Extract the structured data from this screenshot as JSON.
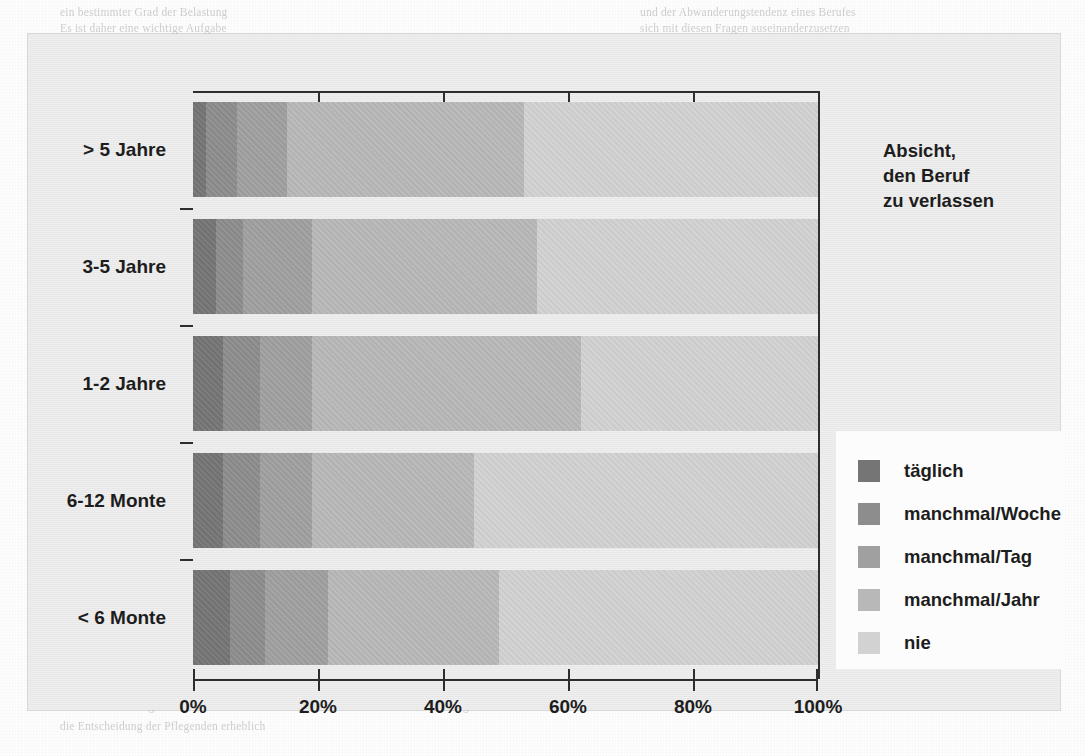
{
  "chart_data": {
    "type": "bar",
    "orientation": "horizontal",
    "stacked": true,
    "normalized": true,
    "title_lines": [
      "Absicht,",
      "den Beruf",
      "zu verlassen"
    ],
    "xlabel": "",
    "ylabel": "",
    "xlim": [
      0,
      100
    ],
    "xticks": [
      0,
      20,
      40,
      60,
      80,
      100
    ],
    "xtick_labels": [
      "0%",
      "20%",
      "40%",
      "60%",
      "80%",
      "100%"
    ],
    "grid": false,
    "legend_position": "right",
    "categories": [
      "> 5 Jahre",
      "3-5 Jahre",
      "1-2 Jahre",
      "6-12 Monte",
      "< 6 Monte"
    ],
    "series": [
      {
        "name": "täglich",
        "color": "#757575",
        "values": [
          2.0,
          3.7,
          4.8,
          4.8,
          5.9
        ]
      },
      {
        "name": "manchmal/Woche",
        "color": "#8d8d8d",
        "values": [
          5.0,
          4.3,
          5.9,
          5.9,
          5.6
        ]
      },
      {
        "name": "manchmal/Tag",
        "color": "#a0a0a0",
        "values": [
          8.0,
          11.0,
          8.3,
          8.3,
          10.1
        ]
      },
      {
        "name": "manchmal/Jahr",
        "color": "#b8b8b8",
        "values": [
          38.0,
          36.0,
          43.0,
          26.0,
          27.4
        ]
      },
      {
        "name": "nie",
        "color": "#d2d2d2",
        "values": [
          47.0,
          45.0,
          38.0,
          55.0,
          51.0
        ]
      }
    ]
  },
  "legend": {
    "items": [
      {
        "label": "täglich"
      },
      {
        "label": "manchmal/Woche"
      },
      {
        "label": "manchmal/Tag"
      },
      {
        "label": "manchmal/Jahr"
      },
      {
        "label": "nie"
      }
    ]
  },
  "background_text": {
    "lines": [
      "ein bestimmter Grad der Belastung",
      "und der Abwanderungstendenz eines Berufes",
      "Es ist daher eine wichtige Aufgabe",
      "sich mit diesen Fragen auseinanderzusetzen",
      "in der Pflegearbeit. Sammelbegriff anzuwenden",
      "Gründe, weshalb sie Pflegende ihren Beruf",
      "die Frage nach der Motivation und der Identität",
      "der eigenen beruflichen Entwicklung",
      "zu ändern. Der Verbleib im Beruf ist unter",
      "sich, sowohl für die Pflegenden als auch",
      "Rahmenbedingungen geben den Beruf",
      "und die Zufriedenheit im Arbeitsalltag",
      "Auch die Belastung durch die Arbeitszeit",
      "und die Arbeitsorganisation beeinflussen",
      "die Entscheidung der Pflegenden erheblich"
    ]
  }
}
